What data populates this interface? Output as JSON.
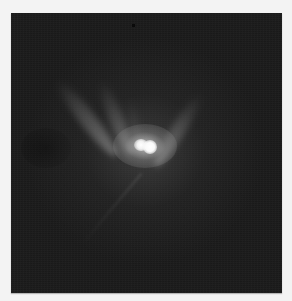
{
  "image": {
    "description": "Grayscale telescope image of an asteroid with a bright double-lobed core and a V-shaped ejecta plume extending upward, against a dark noisy background",
    "colors": {
      "page_background": "#f3f3f3",
      "sky_background": "#1b1b1b",
      "core": "#ffffff",
      "plume": "#969696"
    },
    "features": [
      {
        "name": "bright-core",
        "position": [
          145,
          146
        ]
      },
      {
        "name": "ejecta-arm-left",
        "direction": "upper-left"
      },
      {
        "name": "ejecta-arm-inner-left",
        "direction": "up"
      },
      {
        "name": "ejecta-arm-right",
        "direction": "upper-right"
      }
    ]
  }
}
